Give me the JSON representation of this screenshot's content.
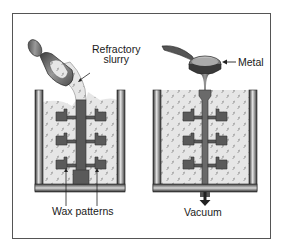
{
  "diagram": {
    "type": "process-illustration",
    "panels": [
      {
        "id": "slurry-investing",
        "labels": {
          "slurry": [
            "Refractory",
            "slurry"
          ],
          "patterns": "Wax patterns"
        },
        "objects": [
          "ladle",
          "refractory-slurry-stream",
          "flask",
          "sprue",
          "wax-pattern-cluster"
        ]
      },
      {
        "id": "vacuum-pouring",
        "labels": {
          "metal": "Metal",
          "vacuum": "Vacuum"
        },
        "objects": [
          "ladle",
          "molten-metal-stream",
          "flask",
          "sprue-cavity",
          "pattern-cavities",
          "vacuum-arrow"
        ]
      }
    ]
  },
  "colors": {
    "frame": "#555555",
    "slurry_fill": "#e6e6e6",
    "speckle": "#8a8a8a",
    "pattern": "#5a5a5a",
    "wall_dark": "#2e2e2e",
    "wall_light": "#d8d8d8",
    "text": "#1a1a1a"
  }
}
